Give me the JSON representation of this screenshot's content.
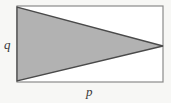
{
  "figure": {
    "type": "geometry-diagram",
    "canvas": {
      "width": 171,
      "height": 103
    },
    "background_color": "#f7f7f5",
    "rectangle": {
      "name": "bounding-rectangle",
      "x": 17,
      "y": 6,
      "width": 146,
      "height": 76,
      "fill": "#ffffff",
      "stroke": "#8a8a8a",
      "stroke_width": 1.2
    },
    "triangle": {
      "name": "shaded-triangle",
      "points": "17,7 17,81 163,46",
      "vertices": [
        {
          "label": "top-left",
          "x": 17,
          "y": 7
        },
        {
          "label": "bottom-left",
          "x": 17,
          "y": 81
        },
        {
          "label": "right-apex",
          "x": 163,
          "y": 46
        }
      ],
      "fill": "#b2b2b2",
      "stroke": "#4a4a4a",
      "stroke_width": 1.3
    },
    "labels": {
      "height_label": "q",
      "width_label": "p"
    }
  }
}
